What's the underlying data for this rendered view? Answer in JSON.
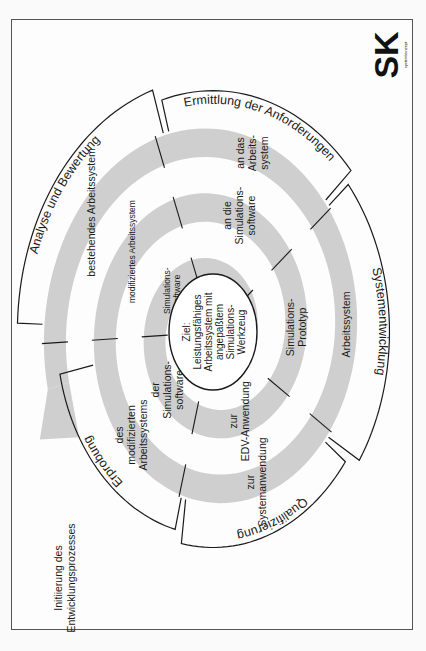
{
  "diagram": {
    "goal": {
      "lines": [
        "Ziel:",
        "Leistungsfähiges",
        "Arbeitssystem mit",
        "angepaßtem",
        "Simulations-",
        "Werkzeug"
      ]
    },
    "start_label": [
      "Initiierung des",
      "Entwicklungsprozesses"
    ],
    "phases": [
      {
        "id": "analyse",
        "label": "Analyse und Bewertung"
      },
      {
        "id": "anforderungen",
        "label": "Ermittlung der Anforderungen"
      },
      {
        "id": "systementwicklung",
        "label": "Systementwicklung"
      },
      {
        "id": "qualifizierung",
        "label": "Qualifizierung"
      },
      {
        "id": "erprobung",
        "label": "Erprobung"
      }
    ],
    "ring_labels": [
      {
        "phase": "analyse",
        "ring": 1,
        "lines": [
          "bestehendes Arbeitssystem"
        ]
      },
      {
        "phase": "anforderungen",
        "ring": 1,
        "lines": [
          "an das",
          "Arbeits-",
          "system"
        ]
      },
      {
        "phase": "systementwicklung",
        "ring": 1,
        "lines": [
          "Arbeitssystem"
        ]
      },
      {
        "phase": "qualifizierung",
        "ring": 1,
        "lines": [
          "zur",
          "Systemanwendung"
        ]
      },
      {
        "phase": "erprobung",
        "ring": 1,
        "lines": [
          "des",
          "modifizierten",
          "Arbeitssystems"
        ]
      },
      {
        "phase": "analyse",
        "ring": 2,
        "lines": [
          "modifiziertes Arbeitssystem"
        ]
      },
      {
        "phase": "anforderungen",
        "ring": 2,
        "lines": [
          "an die",
          "Simulations-",
          "software"
        ]
      },
      {
        "phase": "systementwicklung",
        "ring": 2,
        "lines": [
          "Simulations-",
          "Prototyp"
        ]
      },
      {
        "phase": "qualifizierung",
        "ring": 2,
        "lines": [
          "zur",
          "EDV-Anwendung"
        ]
      },
      {
        "phase": "erprobung",
        "ring": 2,
        "lines": [
          "der",
          "Simulations-",
          "software"
        ]
      },
      {
        "phase": "analyse",
        "ring": 3,
        "lines": [
          "Simulations-",
          "software"
        ]
      }
    ],
    "logo": {
      "text": "SK",
      "subtext": "systemkonzept"
    }
  }
}
